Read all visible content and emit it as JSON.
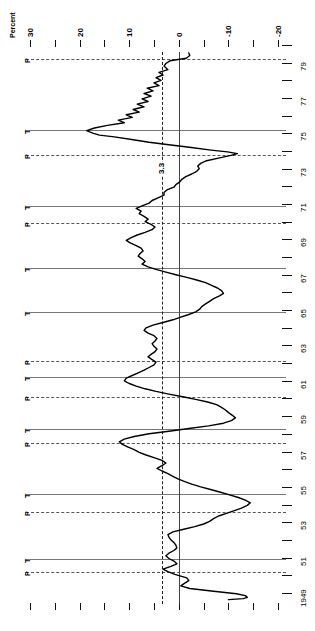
{
  "figure": {
    "axis_title": "Percent",
    "mean_label": "3.3",
    "peak_marker": "P",
    "trough_marker": "T"
  },
  "chart_data": {
    "type": "line",
    "title": "Percent",
    "orientation": "rotated-90",
    "xlabel": "Percent",
    "ylabel": "",
    "grid": false,
    "legend": null,
    "percent_axis": {
      "labels": [
        "30",
        "20",
        "10",
        "0",
        "-10",
        "-20"
      ],
      "label_values": [
        30,
        20,
        10,
        0,
        -10,
        -20
      ],
      "minor_ticks": [
        30,
        25,
        20,
        15,
        10,
        5,
        0,
        -5,
        -10,
        -15,
        -20
      ],
      "range": [
        30,
        -22
      ]
    },
    "year_axis": {
      "labels": [
        "79",
        "77",
        "75",
        "73",
        "71",
        "69",
        "67",
        "65",
        "63",
        "61",
        "59",
        "57",
        "55",
        "53",
        "51",
        "1949"
      ],
      "label_values": [
        1979,
        1977,
        1975,
        1973,
        1971,
        1969,
        1967,
        1965,
        1963,
        1961,
        1959,
        1957,
        1955,
        1953,
        1951,
        1949
      ],
      "range": [
        1979.6,
        1948.6
      ]
    },
    "mean_line": {
      "value": 3.3,
      "label": "3.3",
      "style": "dash-dot"
    },
    "zero_line": {
      "value": 0,
      "style": "solid"
    },
    "reference_lines": [
      {
        "type": "P",
        "name": "peak",
        "year": 1979.2,
        "style": "dashed"
      },
      {
        "type": "T",
        "name": "trough",
        "year": 1975.2,
        "style": "solid"
      },
      {
        "type": "P",
        "name": "peak",
        "year": 1973.8,
        "style": "dashed"
      },
      {
        "type": "T",
        "name": "trough",
        "year": 1970.9,
        "style": "solid"
      },
      {
        "type": "P",
        "name": "peak",
        "year": 1969.9,
        "style": "dashed"
      },
      {
        "type": "T",
        "name": "trough",
        "year": 1967.4,
        "style": "solid"
      },
      {
        "type": "T",
        "name": "trough",
        "year": 1964.9,
        "style": "solid"
      },
      {
        "type": "P",
        "name": "peak",
        "year": 1962.1,
        "style": "dashed"
      },
      {
        "type": "T",
        "name": "trough",
        "year": 1961.2,
        "style": "solid"
      },
      {
        "type": "P",
        "name": "peak",
        "year": 1960.1,
        "style": "dashed"
      },
      {
        "type": "T",
        "name": "trough",
        "year": 1958.3,
        "style": "solid"
      },
      {
        "type": "P",
        "name": "peak",
        "year": 1957.5,
        "style": "dashed"
      },
      {
        "type": "T",
        "name": "trough",
        "year": 1954.6,
        "style": "solid"
      },
      {
        "type": "P",
        "name": "peak",
        "year": 1953.6,
        "style": "dashed"
      },
      {
        "type": "T",
        "name": "trough",
        "year": 1950.9,
        "style": "solid"
      },
      {
        "type": "P",
        "name": "peak",
        "year": 1950.2,
        "style": "dashed"
      }
    ],
    "series": [
      {
        "name": "percent change",
        "points": [
          [
            1979.55,
            -2.0
          ],
          [
            1979.4,
            -2.2
          ],
          [
            1979.25,
            -1.5
          ],
          [
            1979.1,
            1.8
          ],
          [
            1978.95,
            2.6
          ],
          [
            1978.8,
            3.0
          ],
          [
            1978.6,
            2.2
          ],
          [
            1978.45,
            4.0
          ],
          [
            1978.3,
            3.2
          ],
          [
            1978.15,
            4.6
          ],
          [
            1978.0,
            3.6
          ],
          [
            1977.85,
            5.0
          ],
          [
            1977.7,
            4.0
          ],
          [
            1977.55,
            6.4
          ],
          [
            1977.4,
            5.2
          ],
          [
            1977.25,
            7.0
          ],
          [
            1977.1,
            5.6
          ],
          [
            1976.95,
            7.4
          ],
          [
            1976.8,
            6.2
          ],
          [
            1976.65,
            8.4
          ],
          [
            1976.5,
            7.0
          ],
          [
            1976.35,
            9.2
          ],
          [
            1976.2,
            8.0
          ],
          [
            1976.05,
            10.6
          ],
          [
            1975.9,
            9.4
          ],
          [
            1975.75,
            12.2
          ],
          [
            1975.6,
            11.0
          ],
          [
            1975.45,
            14.4
          ],
          [
            1975.3,
            17.0
          ],
          [
            1975.15,
            18.6
          ],
          [
            1975.0,
            17.2
          ],
          [
            1974.9,
            16.0
          ],
          [
            1974.8,
            13.0
          ],
          [
            1974.65,
            9.5
          ],
          [
            1974.5,
            6.0
          ],
          [
            1974.35,
            2.0
          ],
          [
            1974.2,
            -2.5
          ],
          [
            1974.05,
            -6.5
          ],
          [
            1973.95,
            -9.8
          ],
          [
            1973.85,
            -11.8
          ],
          [
            1973.75,
            -10.5
          ],
          [
            1973.6,
            -8.0
          ],
          [
            1973.45,
            -5.6
          ],
          [
            1973.3,
            -4.4
          ],
          [
            1973.15,
            -3.8
          ],
          [
            1973.0,
            -4.1
          ],
          [
            1972.85,
            -3.6
          ],
          [
            1972.7,
            -2.6
          ],
          [
            1972.55,
            -1.4
          ],
          [
            1972.4,
            -0.6
          ],
          [
            1972.25,
            -0.2
          ],
          [
            1972.1,
            0.6
          ],
          [
            1971.95,
            1.0
          ],
          [
            1971.8,
            2.4
          ],
          [
            1971.65,
            3.0
          ],
          [
            1971.5,
            3.0
          ],
          [
            1971.35,
            4.2
          ],
          [
            1971.2,
            5.4
          ],
          [
            1971.05,
            6.0
          ],
          [
            1970.9,
            7.4
          ],
          [
            1970.75,
            8.6
          ],
          [
            1970.6,
            7.6
          ],
          [
            1970.45,
            8.0
          ],
          [
            1970.3,
            7.0
          ],
          [
            1970.15,
            6.2
          ],
          [
            1970.0,
            6.8
          ],
          [
            1969.85,
            5.6
          ],
          [
            1969.7,
            4.8
          ],
          [
            1969.55,
            5.4
          ],
          [
            1969.4,
            6.8
          ],
          [
            1969.25,
            8.4
          ],
          [
            1969.1,
            9.6
          ],
          [
            1968.95,
            10.6
          ],
          [
            1968.8,
            9.8
          ],
          [
            1968.65,
            8.6
          ],
          [
            1968.5,
            7.6
          ],
          [
            1968.35,
            7.2
          ],
          [
            1968.2,
            7.8
          ],
          [
            1968.05,
            8.2
          ],
          [
            1967.9,
            7.4
          ],
          [
            1967.75,
            6.8
          ],
          [
            1967.6,
            7.4
          ],
          [
            1967.45,
            6.2
          ],
          [
            1967.3,
            4.6
          ],
          [
            1967.15,
            2.6
          ],
          [
            1967.0,
            0.6
          ],
          [
            1966.85,
            -1.6
          ],
          [
            1966.7,
            -3.6
          ],
          [
            1966.55,
            -5.4
          ],
          [
            1966.4,
            -6.6
          ],
          [
            1966.25,
            -7.8
          ],
          [
            1966.1,
            -8.6
          ],
          [
            1965.95,
            -9.0
          ],
          [
            1965.8,
            -8.2
          ],
          [
            1965.65,
            -7.0
          ],
          [
            1965.5,
            -6.2
          ],
          [
            1965.35,
            -5.4
          ],
          [
            1965.2,
            -4.6
          ],
          [
            1965.05,
            -4.2
          ],
          [
            1964.9,
            -3.4
          ],
          [
            1964.75,
            -2.0
          ],
          [
            1964.6,
            -0.4
          ],
          [
            1964.45,
            1.2
          ],
          [
            1964.3,
            3.2
          ],
          [
            1964.15,
            5.2
          ],
          [
            1964.0,
            6.6
          ],
          [
            1963.85,
            7.0
          ],
          [
            1963.7,
            6.2
          ],
          [
            1963.55,
            5.0
          ],
          [
            1963.4,
            4.4
          ],
          [
            1963.25,
            4.8
          ],
          [
            1963.1,
            5.4
          ],
          [
            1962.95,
            5.0
          ],
          [
            1962.8,
            4.4
          ],
          [
            1962.65,
            4.8
          ],
          [
            1962.5,
            5.6
          ],
          [
            1962.35,
            6.2
          ],
          [
            1962.2,
            5.4
          ],
          [
            1962.05,
            4.6
          ],
          [
            1961.9,
            5.0
          ],
          [
            1961.75,
            6.0
          ],
          [
            1961.6,
            7.0
          ],
          [
            1961.45,
            8.2
          ],
          [
            1961.3,
            9.4
          ],
          [
            1961.15,
            10.6
          ],
          [
            1961.0,
            11.0
          ],
          [
            1960.85,
            10.0
          ],
          [
            1960.7,
            8.6
          ],
          [
            1960.55,
            6.8
          ],
          [
            1960.4,
            4.6
          ],
          [
            1960.25,
            2.0
          ],
          [
            1960.1,
            -0.8
          ],
          [
            1959.95,
            -3.4
          ],
          [
            1959.8,
            -5.8
          ],
          [
            1959.65,
            -7.6
          ],
          [
            1959.5,
            -8.6
          ],
          [
            1959.35,
            -9.4
          ],
          [
            1959.2,
            -10.0
          ],
          [
            1959.05,
            -10.8
          ],
          [
            1958.9,
            -11.4
          ],
          [
            1958.75,
            -10.6
          ],
          [
            1958.6,
            -9.0
          ],
          [
            1958.45,
            -6.0
          ],
          [
            1958.3,
            -2.0
          ],
          [
            1958.15,
            2.0
          ],
          [
            1958.0,
            6.0
          ],
          [
            1957.85,
            9.0
          ],
          [
            1957.7,
            11.0
          ],
          [
            1957.55,
            12.0
          ],
          [
            1957.4,
            11.4
          ],
          [
            1957.25,
            10.2
          ],
          [
            1957.1,
            9.0
          ],
          [
            1956.95,
            8.0
          ],
          [
            1956.8,
            6.6
          ],
          [
            1956.65,
            5.0
          ],
          [
            1956.5,
            3.4
          ],
          [
            1956.35,
            2.6
          ],
          [
            1956.2,
            3.4
          ],
          [
            1956.05,
            4.4
          ],
          [
            1955.9,
            3.4
          ],
          [
            1955.75,
            2.2
          ],
          [
            1955.6,
            1.2
          ],
          [
            1955.45,
            0.2
          ],
          [
            1955.3,
            -1.2
          ],
          [
            1955.15,
            -2.6
          ],
          [
            1955.0,
            -4.4
          ],
          [
            1954.85,
            -6.4
          ],
          [
            1954.7,
            -8.4
          ],
          [
            1954.55,
            -10.2
          ],
          [
            1954.4,
            -12.0
          ],
          [
            1954.25,
            -13.4
          ],
          [
            1954.1,
            -14.4
          ],
          [
            1953.95,
            -13.8
          ],
          [
            1953.8,
            -12.6
          ],
          [
            1953.65,
            -11.2
          ],
          [
            1953.5,
            -9.6
          ],
          [
            1953.35,
            -8.0
          ],
          [
            1953.2,
            -7.0
          ],
          [
            1953.05,
            -6.2
          ],
          [
            1952.9,
            -5.0
          ],
          [
            1952.75,
            -3.2
          ],
          [
            1952.6,
            -1.0
          ],
          [
            1952.45,
            1.2
          ],
          [
            1952.3,
            2.2
          ],
          [
            1952.15,
            2.0
          ],
          [
            1952.0,
            1.6
          ],
          [
            1951.85,
            1.0
          ],
          [
            1951.7,
            0.6
          ],
          [
            1951.55,
            0.4
          ],
          [
            1951.4,
            1.0
          ],
          [
            1951.25,
            2.0
          ],
          [
            1951.1,
            2.6
          ],
          [
            1950.95,
            2.0
          ],
          [
            1950.8,
            1.0
          ],
          [
            1950.65,
            0.4
          ],
          [
            1950.5,
            1.6
          ],
          [
            1950.35,
            3.2
          ],
          [
            1950.2,
            2.2
          ],
          [
            1950.05,
            0.8
          ],
          [
            1949.95,
            -0.4
          ],
          [
            1949.85,
            -1.6
          ],
          [
            1949.7,
            -2.0
          ],
          [
            1949.55,
            -1.2
          ],
          [
            1949.4,
            -0.4
          ],
          [
            1949.25,
            -2.2
          ],
          [
            1949.1,
            -7.0
          ],
          [
            1948.95,
            -11.6
          ],
          [
            1948.85,
            -13.4
          ],
          [
            1948.75,
            -13.8
          ],
          [
            1948.68,
            -13.0
          ],
          [
            1948.62,
            -10.0
          ]
        ]
      }
    ]
  }
}
